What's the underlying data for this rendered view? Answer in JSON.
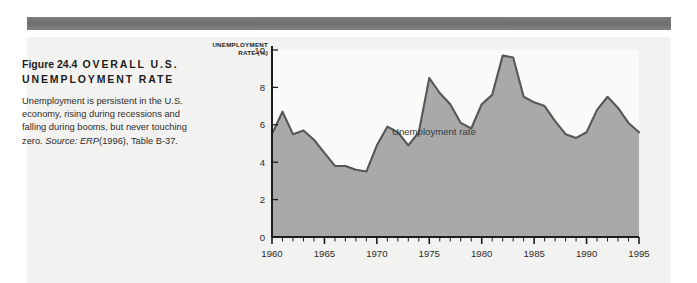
{
  "figure": {
    "number": "Figure 24.4",
    "title": "OVERALL U.S. UNEMPLOYMENT RATE",
    "body_text": "Unemployment is persistent in the U.S. economy, rising during recessions and falling during booms, but never touching zero.",
    "source_label": "Source:",
    "source_italic": "ERP",
    "source_rest": "(1996), Table B-37."
  },
  "colors": {
    "area_fill": "#a9a9a9",
    "area_line": "#575757",
    "plot_background": "#fafaf8",
    "panel_background": "#f2f2f0",
    "top_rule": "#757575",
    "axis": "#1d1d1d"
  },
  "chart_data": {
    "type": "area",
    "title": "OVERALL U.S. UNEMPLOYMENT RATE",
    "xlabel": "",
    "ylabel": "UNEMPLOYMENT RATE (%)",
    "ylabel_line1": "UNEMPLOYMENT",
    "ylabel_line2": "RATE (%)",
    "annotation": "Unemployment rate",
    "legend_position": "inline-annotation",
    "grid": false,
    "xlim": [
      1960,
      1995
    ],
    "ylim": [
      0,
      10
    ],
    "yticks": [
      0,
      2,
      4,
      6,
      8,
      10
    ],
    "ytick_labels": [
      "0",
      "2",
      "4",
      "6",
      "8",
      "10"
    ],
    "xticks": [
      1960,
      1965,
      1970,
      1975,
      1980,
      1985,
      1990,
      1995
    ],
    "xtick_labels": [
      "1960",
      "1965",
      "1970",
      "1975",
      "1980",
      "1985",
      "1990",
      "1995"
    ],
    "x_minor_tick_step": 1,
    "series": [
      {
        "name": "Unemployment rate",
        "x": [
          1960,
          1961,
          1962,
          1963,
          1964,
          1965,
          1966,
          1967,
          1968,
          1969,
          1970,
          1971,
          1972,
          1973,
          1974,
          1975,
          1976,
          1977,
          1978,
          1979,
          1980,
          1981,
          1982,
          1983,
          1984,
          1985,
          1986,
          1987,
          1988,
          1989,
          1990,
          1991,
          1992,
          1993,
          1994,
          1995
        ],
        "values": [
          5.5,
          6.7,
          5.5,
          5.7,
          5.2,
          4.5,
          3.8,
          3.8,
          3.6,
          3.5,
          4.9,
          5.9,
          5.6,
          4.9,
          5.6,
          8.5,
          7.7,
          7.1,
          6.1,
          5.8,
          7.1,
          7.6,
          9.7,
          9.6,
          7.5,
          7.2,
          7.0,
          6.2,
          5.5,
          5.3,
          5.6,
          6.8,
          7.5,
          6.9,
          6.1,
          5.6
        ]
      }
    ]
  }
}
